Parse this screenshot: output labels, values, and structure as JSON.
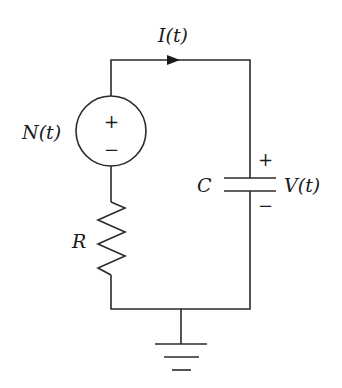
{
  "diagram": {
    "type": "circuit",
    "title": "",
    "labels": {
      "current": "I(t)",
      "source": "N(t)",
      "capacitor": "C",
      "voltage": "V(t)",
      "resistor": "R"
    },
    "source_polarity": {
      "plus": "+",
      "minus": "−"
    },
    "capacitor_polarity": {
      "plus": "+",
      "minus": "−"
    },
    "components": [
      {
        "id": "source",
        "kind": "voltage-source",
        "label": "N(t)"
      },
      {
        "id": "resistor",
        "kind": "resistor",
        "label": "R"
      },
      {
        "id": "capacitor",
        "kind": "capacitor",
        "label": "C",
        "voltage_label": "V(t)"
      },
      {
        "id": "ground",
        "kind": "ground"
      }
    ],
    "current_direction": "clockwise (left to right on top wire)"
  }
}
